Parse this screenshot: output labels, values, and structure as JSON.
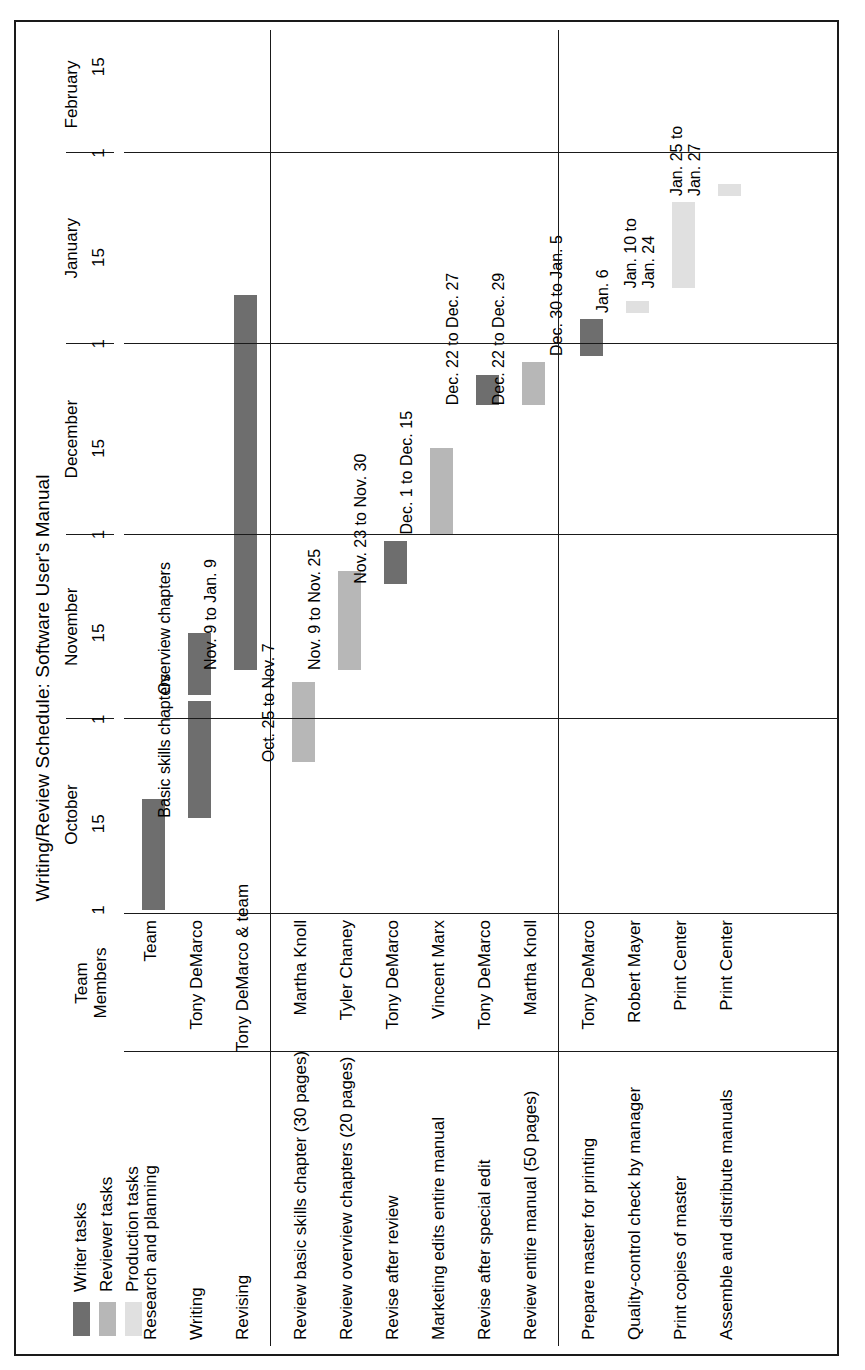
{
  "title": "Writing/Review Schedule: Software User's Manual",
  "legend": {
    "items": [
      {
        "label": "Writer tasks",
        "color": "#6e6e6e"
      },
      {
        "label": "Reviewer tasks",
        "color": "#b7b7b7"
      },
      {
        "label": "Production tasks",
        "color": "#e0e0e0"
      }
    ]
  },
  "columns": {
    "task": "",
    "team_members_line1": "Team",
    "team_members_line2": "Members"
  },
  "timeline": {
    "months": [
      "October",
      "November",
      "December",
      "January",
      "February"
    ],
    "tick_labels": [
      "1",
      "15",
      "1",
      "15",
      "1",
      "15",
      "1",
      "15",
      "1",
      "15"
    ],
    "annotations": {
      "basic_skills": "Basic skills chapters",
      "overview": "Overview chapters"
    }
  },
  "chart_data": {
    "type": "bar",
    "title": "Writing/Review Schedule: Software User's Manual",
    "xlabel": "",
    "ylabel": "",
    "axis_months": [
      "October",
      "November",
      "December",
      "January",
      "February"
    ],
    "axis_ticks": [
      "1",
      "15",
      "1",
      "15",
      "1",
      "15",
      "1",
      "15",
      "1",
      "15"
    ],
    "legend_position": "top-left",
    "grid": true,
    "groups": [
      {
        "name": "writer",
        "tasks": [
          {
            "task": "Research and planning",
            "member": "Team",
            "category": "Writer tasks",
            "color": "#6e6e6e",
            "bars": [
              {
                "label": "",
                "start": "Oct. 1",
                "end": "Oct. 19"
              }
            ]
          },
          {
            "task": "Writing",
            "member": "Tony DeMarco",
            "category": "Writer tasks",
            "color": "#6e6e6e",
            "bars": [
              {
                "label": "Basic skills chapters",
                "start": "Oct. 16",
                "end": "Nov. 4"
              },
              {
                "label": "Overview chapters",
                "start": "Nov. 5",
                "end": "Nov. 15"
              }
            ]
          },
          {
            "task": "Revising",
            "member": "Tony DeMarco & team",
            "category": "Writer tasks",
            "color": "#6e6e6e",
            "bars": [
              {
                "label": "Nov. 9 to Jan. 9",
                "start": "Nov. 9",
                "end": "Jan. 9"
              }
            ]
          }
        ]
      },
      {
        "name": "reviewer",
        "tasks": [
          {
            "task": "Review basic skills chapter (30 pages)",
            "member": "Martha Knoll",
            "category": "Reviewer tasks",
            "color": "#b7b7b7",
            "bars": [
              {
                "label": "Oct. 25 to Nov. 7",
                "start": "Oct. 25",
                "end": "Nov. 7"
              }
            ]
          },
          {
            "task": "Review overview chapters (20 pages)",
            "member": "Tyler Chaney",
            "category": "Reviewer tasks",
            "color": "#b7b7b7",
            "bars": [
              {
                "label": "Nov. 9 to Nov. 25",
                "start": "Nov. 9",
                "end": "Nov. 25"
              }
            ]
          },
          {
            "task": "Revise after review",
            "member": "Tony DeMarco",
            "category": "Writer tasks",
            "color": "#6e6e6e",
            "bars": [
              {
                "label": "Nov. 23 to Nov. 30",
                "start": "Nov. 23",
                "end": "Nov. 30"
              }
            ]
          },
          {
            "task": "Marketing edits entire manual",
            "member": "Vincent Marx",
            "category": "Reviewer tasks",
            "color": "#b7b7b7",
            "bars": [
              {
                "label": "Dec. 1 to Dec. 15",
                "start": "Dec. 1",
                "end": "Dec. 15"
              }
            ]
          },
          {
            "task": "Revise after special edit",
            "member": "Tony DeMarco",
            "category": "Writer tasks",
            "color": "#6e6e6e",
            "bars": [
              {
                "label": "Dec. 22 to Dec. 27",
                "start": "Dec. 22",
                "end": "Dec. 27"
              }
            ]
          },
          {
            "task": "Review entire manual (50 pages)",
            "member": "Martha Knoll",
            "category": "Reviewer tasks",
            "color": "#b7b7b7",
            "bars": [
              {
                "label": "Dec. 22 to Dec. 29",
                "start": "Dec. 22",
                "end": "Dec. 29"
              }
            ]
          }
        ]
      },
      {
        "name": "production",
        "tasks": [
          {
            "task": "Prepare master for printing",
            "member": "Tony DeMarco",
            "category": "Writer tasks",
            "color": "#6e6e6e",
            "bars": [
              {
                "label": "Dec. 30 to Jan. 5",
                "start": "Dec. 30",
                "end": "Jan. 5"
              }
            ]
          },
          {
            "task": "Quality-control check by manager",
            "member": "Robert Mayer",
            "category": "Production tasks",
            "color": "#e0e0e0",
            "bars": [
              {
                "label": "Jan. 6",
                "start": "Jan. 6",
                "end": "Jan. 8"
              }
            ]
          },
          {
            "task": "Print copies of master",
            "member": "Print Center",
            "category": "Production tasks",
            "color": "#e0e0e0",
            "bars": [
              {
                "label": "Jan. 10 to\nJan. 24",
                "start": "Jan. 10",
                "end": "Jan. 24"
              }
            ]
          },
          {
            "task": "Assemble and distribute manuals",
            "member": "Print Center",
            "category": "Production tasks",
            "color": "#e0e0e0",
            "bars": [
              {
                "label": "Jan. 25 to\nJan. 27",
                "start": "Jan. 25",
                "end": "Jan. 27"
              }
            ]
          }
        ]
      }
    ]
  }
}
